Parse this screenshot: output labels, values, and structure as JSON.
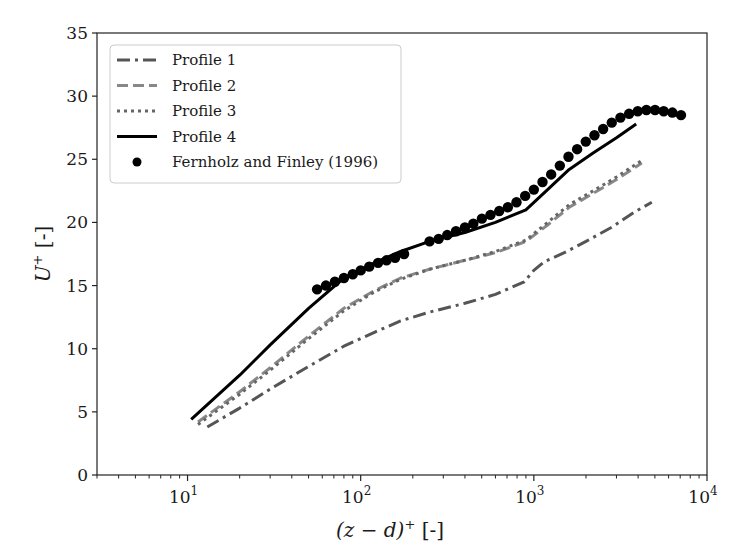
{
  "chart_data": {
    "type": "line",
    "title": "",
    "xlabel": "(z − d)⁺ [-]",
    "ylabel": "U⁺ [-]",
    "xscale": "log",
    "xlim": [
      3,
      10000
    ],
    "ylim": [
      0,
      35
    ],
    "grid": false,
    "legend_position": "upper left",
    "x_ticks": [
      10,
      100,
      1000,
      10000
    ],
    "x_tick_labels": [
      "10¹",
      "10²",
      "10³",
      "10⁴"
    ],
    "y_ticks": [
      0,
      5,
      10,
      15,
      20,
      25,
      30,
      35
    ],
    "y_tick_labels": [
      "0",
      "5",
      "10",
      "15",
      "20",
      "25",
      "30",
      "35"
    ],
    "series": [
      {
        "name": "Profile 1",
        "style": "dashdot",
        "color": "#555555",
        "x": [
          13,
          20,
          30,
          50,
          80,
          120,
          170,
          250,
          400,
          600,
          880,
          1000,
          1150,
          1500,
          2000,
          2800,
          3800,
          4800
        ],
        "y": [
          3.8,
          5.3,
          6.8,
          8.6,
          10.2,
          11.3,
          12.2,
          12.9,
          13.6,
          14.3,
          15.3,
          16.2,
          16.9,
          17.6,
          18.5,
          19.6,
          20.8,
          21.6
        ]
      },
      {
        "name": "Profile 2",
        "style": "dashed",
        "color": "#888888",
        "x": [
          11.5,
          20,
          30,
          50,
          80,
          120,
          170,
          250,
          400,
          600,
          900,
          1200,
          1600,
          2200,
          3000,
          4200
        ],
        "y": [
          4.2,
          6.6,
          8.5,
          11.0,
          13.2,
          14.6,
          15.6,
          16.3,
          17.0,
          17.6,
          18.5,
          19.8,
          21.2,
          22.3,
          23.4,
          24.7
        ]
      },
      {
        "name": "Profile 3",
        "style": "dotted",
        "color": "#666666",
        "x": [
          11.5,
          20,
          30,
          50,
          80,
          120,
          170,
          250,
          400,
          600,
          900,
          1200,
          1600,
          2200,
          3000,
          4200
        ],
        "y": [
          4.0,
          6.4,
          8.3,
          10.8,
          13.0,
          14.5,
          15.5,
          16.3,
          17.0,
          17.7,
          18.6,
          20.0,
          21.4,
          22.5,
          23.6,
          24.9
        ]
      },
      {
        "name": "Profile 4",
        "style": "solid",
        "color": "#000000",
        "x": [
          10.5,
          20,
          30,
          50,
          80,
          120,
          170,
          250,
          400,
          600,
          900,
          1200,
          1600,
          2200,
          3000,
          3900
        ],
        "y": [
          4.4,
          7.9,
          10.3,
          13.2,
          15.6,
          16.8,
          17.7,
          18.5,
          19.2,
          20.0,
          21.0,
          22.6,
          24.2,
          25.5,
          26.7,
          27.8
        ]
      },
      {
        "name": "Fernholz and Finley (1996)",
        "style": "markers",
        "marker": "circle",
        "color": "#000000",
        "x": [
          56,
          63,
          71,
          80,
          90,
          100,
          112,
          126,
          141,
          158,
          178,
          250,
          282,
          316,
          355,
          400,
          447,
          501,
          562,
          631,
          708,
          794,
          891,
          1000,
          1122,
          1259,
          1413,
          1585,
          1778,
          1995,
          2239,
          2512,
          2818,
          3162,
          3548,
          3981,
          4467,
          5012,
          5623,
          6310,
          7079
        ],
        "y": [
          14.7,
          15.0,
          15.3,
          15.6,
          15.9,
          16.2,
          16.5,
          16.8,
          17.0,
          17.2,
          17.5,
          18.5,
          18.7,
          19.0,
          19.3,
          19.6,
          19.9,
          20.3,
          20.6,
          20.9,
          21.2,
          21.6,
          22.1,
          22.6,
          23.2,
          23.8,
          24.5,
          25.2,
          25.8,
          26.4,
          26.9,
          27.4,
          27.9,
          28.3,
          28.6,
          28.8,
          28.9,
          28.9,
          28.8,
          28.7,
          28.5
        ]
      }
    ]
  },
  "legend": {
    "items": [
      {
        "label": "Profile 1"
      },
      {
        "label": "Profile 2"
      },
      {
        "label": "Profile 3"
      },
      {
        "label": "Profile 4"
      },
      {
        "label": "Fernholz and Finley (1996)"
      }
    ]
  }
}
